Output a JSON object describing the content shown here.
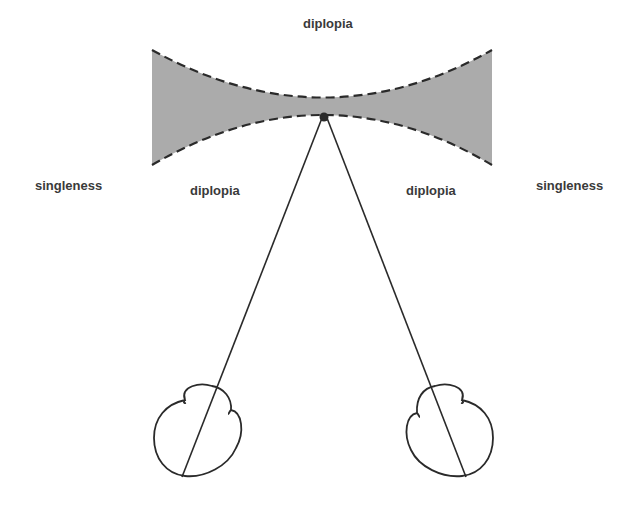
{
  "diagram": {
    "type": "binocular-vision-panums-area",
    "labels": {
      "top": "diplopia",
      "left_outer": "singleness",
      "left_inner": "diplopia",
      "right_inner": "diplopia",
      "right_outer": "singleness"
    },
    "region": {
      "name": "single-vision-zone",
      "fill": "#a9a9a9",
      "border_style": "dashed"
    },
    "fixation_point": {
      "x": 324,
      "y": 117
    },
    "eyes": [
      {
        "name": "left-eye",
        "cx": 190,
        "cy": 428,
        "r": 36
      },
      {
        "name": "right-eye",
        "cx": 455,
        "cy": 428,
        "r": 36
      }
    ],
    "colors": {
      "stroke": "#2a2a2a",
      "text": "#3a3a3a"
    }
  }
}
